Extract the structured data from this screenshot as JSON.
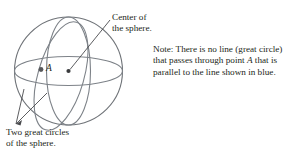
{
  "figure": {
    "colors": {
      "sphere_outline": "#6f7378",
      "great_circle": "#7d8288",
      "text": "#231f20",
      "point_dot": "#57585b",
      "leader_line": "#4a4b4e",
      "background": "#ffffff"
    },
    "point_label": "A",
    "annotations": {
      "center": {
        "line1": "Center of",
        "line2": "the sphere."
      },
      "two_circles": {
        "line1": "Two great circles",
        "line2": "of the sphere."
      },
      "note": {
        "line1_a": "Note: There is no line (great circle)",
        "line2_a": "that passes through point ",
        "line2_italic": "A",
        "line2_b": " that is",
        "line3_a": "parallel to the line shown in blue."
      }
    }
  }
}
